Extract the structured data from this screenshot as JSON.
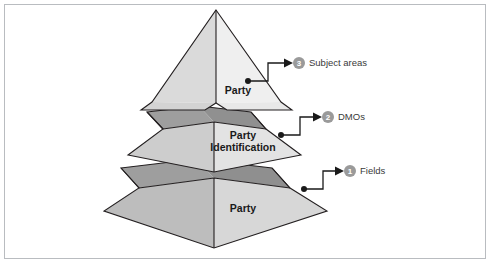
{
  "figure": {
    "type": "3d-layered-pyramid-diagram",
    "border_color": "#b9bcc0",
    "background": "#ffffff"
  },
  "pyramid": {
    "tiers": [
      {
        "id": "top",
        "label": "Party",
        "label_lines": [
          "Party"
        ],
        "left_face_color": "#d8d8d8",
        "right_face_color": "#eeeeee",
        "top_band_color": "#a8a8a8"
      },
      {
        "id": "middle",
        "label": "Party Identification",
        "label_lines": [
          "Party",
          "Identification"
        ],
        "left_face_color": "#cdcdcd",
        "right_face_color": "#e4e4e4",
        "top_band_color": "#a0a0a0"
      },
      {
        "id": "bottom",
        "label": "Party",
        "label_lines": [
          "Party"
        ],
        "left_face_color": "#bdbdbd",
        "right_face_color": "#d6d6d6",
        "top_band_color": "#9a9a9a"
      }
    ]
  },
  "callouts": [
    {
      "number": "3",
      "label": "Subject areas",
      "target_tier": "top",
      "badge_color": "#9a9a9a"
    },
    {
      "number": "2",
      "label": "DMOs",
      "target_tier": "middle",
      "badge_color": "#9a9a9a"
    },
    {
      "number": "1",
      "label": "Fields",
      "target_tier": "bottom",
      "badge_color": "#9a9a9a"
    }
  ]
}
